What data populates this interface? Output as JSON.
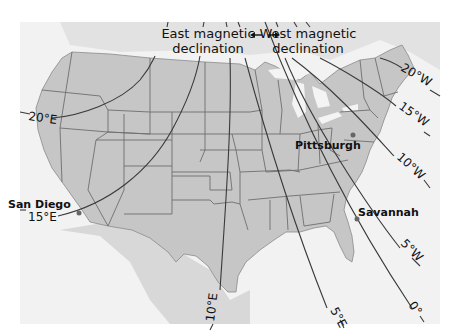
{
  "title": {
    "east": [
      "East magnetic",
      "declination"
    ],
    "west": [
      "West magnetic",
      "declination"
    ],
    "arrow": "double-arrow-icon"
  },
  "isogonic_lines": [
    {
      "label": "20°E",
      "value": 20,
      "direction": "E"
    },
    {
      "label": "15°E",
      "value": 15,
      "direction": "E"
    },
    {
      "label": "10°E",
      "value": 10,
      "direction": "E"
    },
    {
      "label": "5°E",
      "value": 5,
      "direction": "E"
    },
    {
      "label": "0°",
      "value": 0,
      "direction": ""
    },
    {
      "label": "5°W",
      "value": 5,
      "direction": "W"
    },
    {
      "label": "10°W",
      "value": 10,
      "direction": "W"
    },
    {
      "label": "15°W",
      "value": 15,
      "direction": "W"
    },
    {
      "label": "20°W",
      "value": 20,
      "direction": "W"
    }
  ],
  "cities": [
    {
      "name": "San Diego"
    },
    {
      "name": "Pittsburgh"
    },
    {
      "name": "Savannah"
    }
  ],
  "colors": {
    "land": "#c6c6c6",
    "water": "#f2f2f2",
    "lines": "#3a3a3a"
  }
}
